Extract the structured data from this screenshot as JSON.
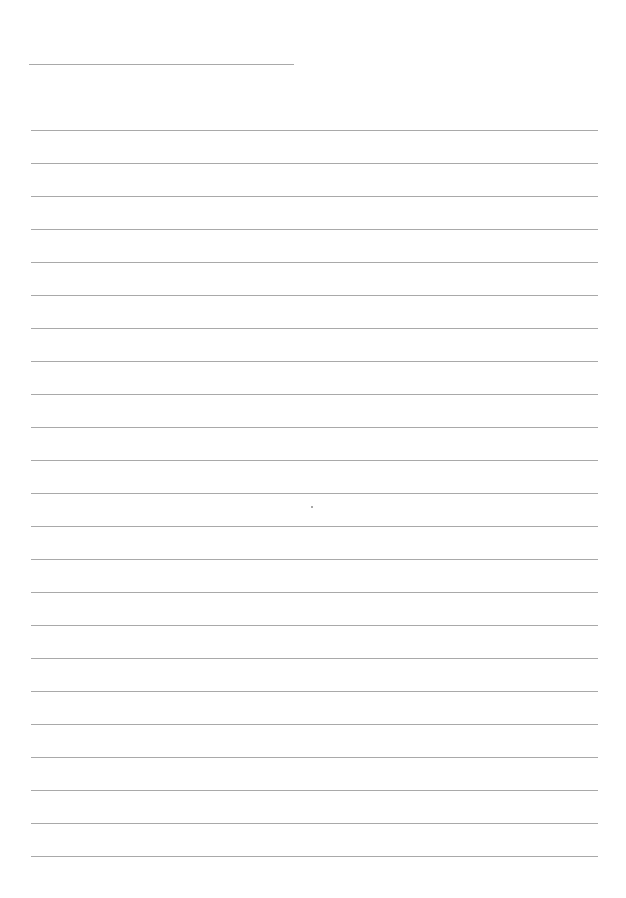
{
  "page": {
    "type": "lined-paper",
    "background_color": "#ffffff",
    "rule_color": "#a9a9a9",
    "header_line": {
      "x": 29,
      "y": 64,
      "width": 265
    },
    "lines": {
      "count": 23,
      "first_y": 130,
      "spacing": 33,
      "x_start": 31,
      "x_end": 598
    },
    "marks": [
      {
        "x": 311,
        "y": 506
      }
    ]
  }
}
